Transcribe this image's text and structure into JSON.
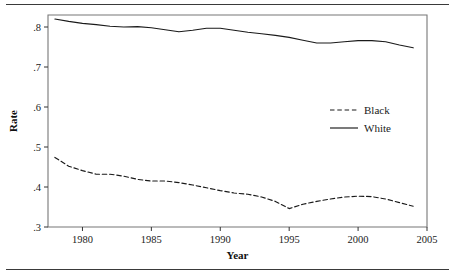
{
  "figure": {
    "has_top_rule": true,
    "has_bottom_rule": true,
    "background": "#ffffff",
    "ink_color": "#1a1a1a"
  },
  "chart_data": {
    "type": "line",
    "title": "",
    "subtitle": "",
    "xlabel": "Year",
    "ylabel": "Rate",
    "xlim": [
      1977.5,
      2005.0
    ],
    "ylim": [
      0.3,
      0.83
    ],
    "xticks": [
      1980,
      1985,
      1990,
      1995,
      2000,
      2005
    ],
    "xticklabels": [
      "1980",
      "1985",
      "1990",
      "1995",
      "2000",
      "2005"
    ],
    "yticks": [
      0.3,
      0.4,
      0.5,
      0.6,
      0.7,
      0.8
    ],
    "yticklabels": [
      ".3",
      ".4",
      ".5",
      ".6",
      ".7",
      ".8"
    ],
    "grid": false,
    "legend_position": "center-right",
    "series": [
      {
        "name": "Black",
        "style": "dashed",
        "color": "#1a1a1a",
        "x": [
          1978,
          1979,
          1980,
          1981,
          1982,
          1983,
          1984,
          1985,
          1986,
          1987,
          1988,
          1989,
          1990,
          1991,
          1992,
          1993,
          1994,
          1995,
          1996,
          1997,
          1998,
          1999,
          2000,
          2001,
          2002,
          2003,
          2004
        ],
        "values": [
          0.474,
          0.452,
          0.441,
          0.432,
          0.432,
          0.427,
          0.419,
          0.415,
          0.415,
          0.411,
          0.405,
          0.398,
          0.391,
          0.385,
          0.382,
          0.375,
          0.364,
          0.346,
          0.357,
          0.364,
          0.37,
          0.375,
          0.377,
          0.376,
          0.37,
          0.361,
          0.352
        ]
      },
      {
        "name": "White",
        "style": "solid",
        "color": "#1a1a1a",
        "x": [
          1978,
          1979,
          1980,
          1981,
          1982,
          1983,
          1984,
          1985,
          1986,
          1987,
          1988,
          1989,
          1990,
          1991,
          1992,
          1993,
          1994,
          1995,
          1996,
          1997,
          1998,
          1999,
          2000,
          2001,
          2002,
          2003,
          2004
        ],
        "values": [
          0.82,
          0.814,
          0.809,
          0.806,
          0.802,
          0.8,
          0.801,
          0.798,
          0.793,
          0.788,
          0.792,
          0.797,
          0.797,
          0.792,
          0.787,
          0.783,
          0.779,
          0.774,
          0.767,
          0.76,
          0.76,
          0.763,
          0.766,
          0.766,
          0.763,
          0.755,
          0.748
        ]
      }
    ]
  },
  "legend": {
    "entries": [
      {
        "label": "Black",
        "style": "dashed"
      },
      {
        "label": "White",
        "style": "solid"
      }
    ]
  }
}
